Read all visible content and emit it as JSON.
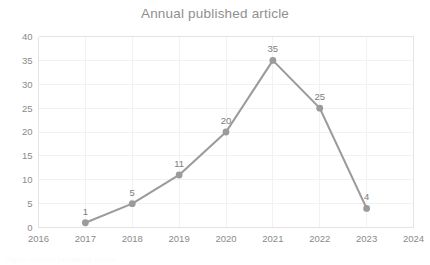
{
  "chart_data": {
    "type": "line",
    "title": "Annual published article",
    "xlabel": "",
    "ylabel": "",
    "x": [
      "2016",
      "2017",
      "2018",
      "2019",
      "2020",
      "2021",
      "2022",
      "2023",
      "2024"
    ],
    "categories": [
      "2016",
      "2017",
      "2018",
      "2019",
      "2020",
      "2021",
      "2022",
      "2023",
      "2024"
    ],
    "series": [
      {
        "name": "Annual published article",
        "x": [
          "2017",
          "2018",
          "2019",
          "2020",
          "2021",
          "2022",
          "2023"
        ],
        "values": [
          1,
          5,
          11,
          20,
          35,
          25,
          4
        ],
        "color": "#9b9b9b",
        "marker": "circle",
        "data_labels": [
          "1",
          "5",
          "11",
          "20",
          "35",
          "25",
          "4"
        ]
      }
    ],
    "ylim": [
      0,
      40
    ],
    "yticks": [
      0,
      5,
      10,
      15,
      20,
      25,
      30,
      35,
      40
    ],
    "ytick_labels": [
      "0",
      "5",
      "10",
      "15",
      "20",
      "25",
      "30",
      "35",
      "40"
    ],
    "xtick_labels": [
      "2016",
      "2017",
      "2018",
      "2019",
      "2020",
      "2021",
      "2022",
      "2023",
      "2024"
    ],
    "grid": {
      "horizontal": true,
      "vertical": true,
      "color": "#f2f2f2"
    },
    "legend": {
      "visible": false,
      "position": "none"
    },
    "colors": {
      "line": "#9b9b9b",
      "marker": "#9b9b9b",
      "title": "#8f8f8f",
      "tick": "#8a8a8a",
      "label": "#7d7d7d",
      "grid": "#f2f2f2",
      "axis": "#e4e4e4",
      "background": "#ffffff"
    }
  },
  "footer": {
    "caption": "Figure: Annual published article"
  }
}
